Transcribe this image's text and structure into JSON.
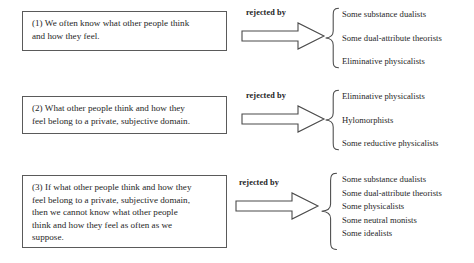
{
  "diagram": {
    "relation_label": "rejected by",
    "colors": {
      "box_border": "#5a5a5a",
      "arrow_stroke": "#4a4a4a",
      "brace_stroke": "#4a4a4a",
      "text": "#262626",
      "background": "#ffffff"
    },
    "groups": [
      {
        "id": "premise-1",
        "premise_lines": [
          "(1) We often know what other people think",
          "and how they feel."
        ],
        "relation_label": "rejected by",
        "rejectors": [
          "Some substance dualists",
          "Some dual-attribute theorists",
          "Eliminative physicalists"
        ]
      },
      {
        "id": "premise-2",
        "premise_lines": [
          "(2) What other people think and how they",
          "feel belong to a private, subjective domain."
        ],
        "relation_label": "rejected by",
        "rejectors": [
          "Eliminative physicalists",
          "Hylomorphists",
          "Some reductive physicalists"
        ]
      },
      {
        "id": "premise-3",
        "premise_lines": [
          "(3) If what other people think and how they",
          "feel belong to a private, subjective domain,",
          "then we cannot know what other people",
          "think and how they feel as often as we",
          "suppose."
        ],
        "relation_label": "rejected by",
        "rejectors": [
          "Some substance dualists",
          "Some dual-attribute theorists",
          "Some physicalists",
          "Some neutral monists",
          "Some idealists"
        ]
      }
    ]
  }
}
